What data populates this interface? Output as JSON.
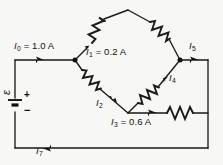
{
  "figure": {
    "kind": "circuit-diagram",
    "width": 223,
    "height": 165,
    "background_color": "#f7f7f5",
    "ink_color": "#111111"
  },
  "labels": {
    "i0": {
      "symbol": "I",
      "subscript": "0",
      "value": "= 1.0 A",
      "text": "I0 = 1.0 A"
    },
    "i1": {
      "symbol": "I",
      "subscript": "1",
      "value": "= 0.2 A",
      "text": "I1 = 0.2 A"
    },
    "i2": {
      "symbol": "I",
      "subscript": "2",
      "value": "",
      "text": "I2"
    },
    "i3": {
      "symbol": "I",
      "subscript": "3",
      "value": "= 0.6 A",
      "text": "I3 = 0.6 A"
    },
    "i4": {
      "symbol": "I",
      "subscript": "4",
      "value": "",
      "text": "I4"
    },
    "i5": {
      "symbol": "I",
      "subscript": "5",
      "value": "",
      "text": "I5"
    },
    "i7": {
      "symbol": "I",
      "subscript": "7",
      "value": "",
      "text": "I7"
    },
    "emf": {
      "symbol": "ε",
      "text": "ε"
    },
    "battery_plus": "+",
    "battery_minus": "−"
  },
  "components": {
    "resistors": [
      {
        "name": "resistor-top-left",
        "branch": "I1",
        "orientation": "diagonal-up-right"
      },
      {
        "name": "resistor-top-right",
        "branch": "I5",
        "orientation": "diagonal-down-right"
      },
      {
        "name": "resistor-bottom-left",
        "branch": "I2",
        "orientation": "diagonal-down-right"
      },
      {
        "name": "resistor-bottom-right",
        "branch": "I4",
        "orientation": "diagonal-up-right"
      },
      {
        "name": "resistor-horizontal",
        "branch": "I3",
        "orientation": "horizontal"
      }
    ],
    "battery": {
      "name": "emf-source",
      "polarity_top": "+",
      "polarity_bottom": "−"
    },
    "nodes": [
      {
        "name": "node-left",
        "x": 75,
        "y": 60
      },
      {
        "name": "node-right",
        "x": 180,
        "y": 60
      },
      {
        "name": "node-bottom",
        "x": 128,
        "y": 113
      },
      {
        "name": "node-top",
        "x": 128,
        "y": 10
      }
    ]
  },
  "currents": {
    "i0_amps": 1.0,
    "i1_amps": 0.2,
    "i3_amps": 0.6,
    "unit": "A"
  }
}
